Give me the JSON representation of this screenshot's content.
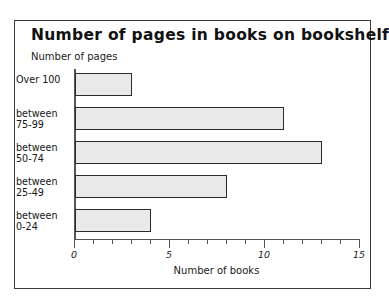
{
  "chart_data": {
    "type": "bar",
    "orientation": "horizontal",
    "title": "Number of pages in books on bookshelf",
    "xlabel": "Number of books",
    "ylabel": "Number of pages",
    "categories": [
      "Over 100",
      "between\n75-99",
      "between\n50-74",
      "between\n25-49",
      "between\n0-24"
    ],
    "values": [
      3,
      11,
      13,
      8,
      4
    ],
    "xlim": [
      0,
      15
    ],
    "xticks": [
      0,
      1,
      2,
      3,
      4,
      5,
      6,
      7,
      8,
      9,
      10,
      11,
      12,
      13,
      14,
      15
    ],
    "xtick_labels": [
      "0",
      "",
      "",
      "",
      "",
      "5",
      "",
      "",
      "",
      "",
      "10",
      "",
      "",
      "",
      "",
      "15"
    ],
    "major_ticks": [
      0,
      5,
      10,
      15
    ],
    "grid": false,
    "legend": null,
    "bar_fill_color": "#e9e9e9",
    "bar_edge_color": "#2b2b2b",
    "axis_color": "#555555",
    "text_color": "#151515",
    "background_color": "#ffffff"
  },
  "frame": {
    "border_color": "#3a3a3a"
  }
}
